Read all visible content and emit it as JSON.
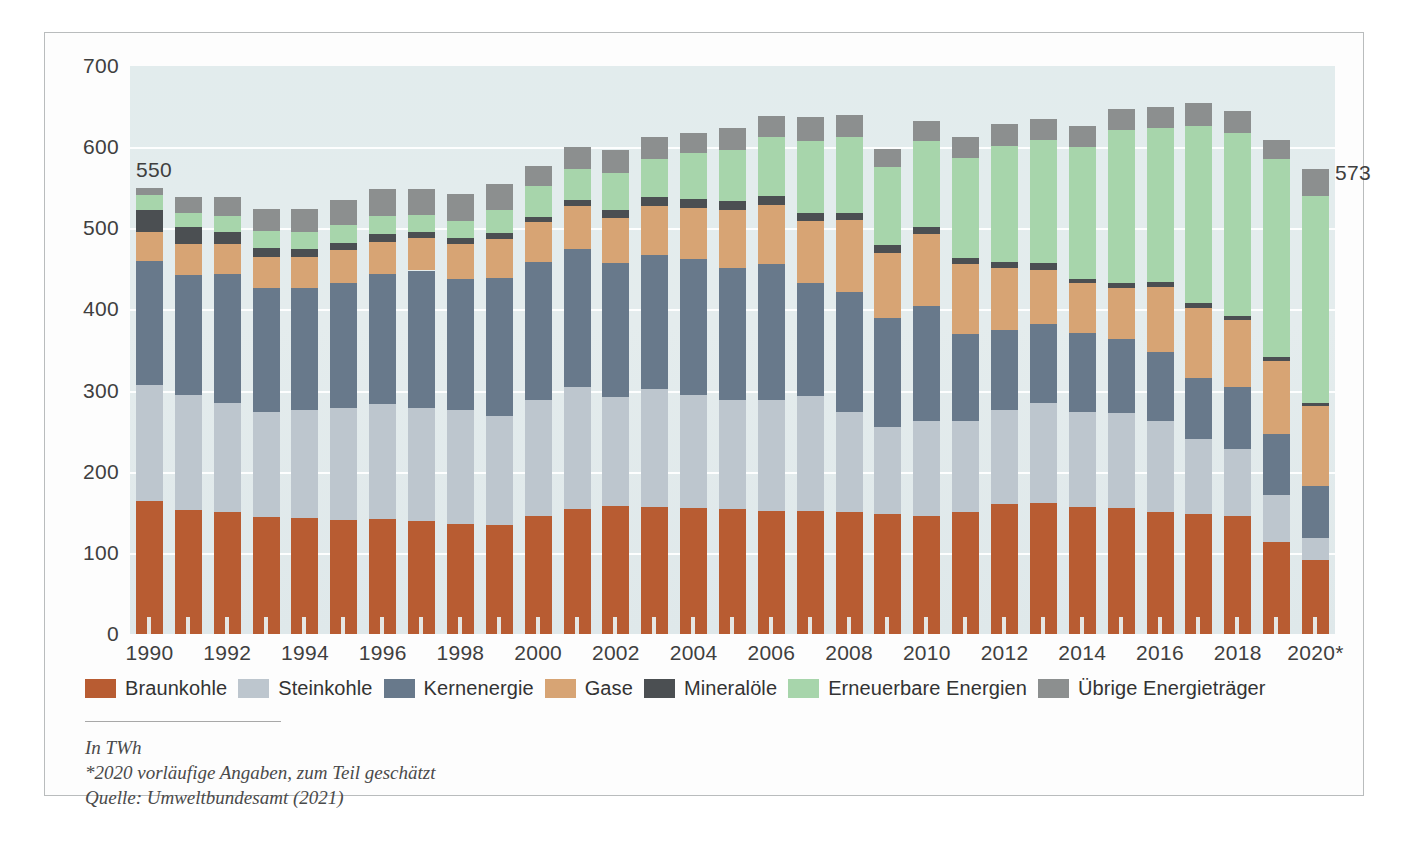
{
  "chart_data": {
    "type": "bar",
    "subtype": "stacked",
    "title": "",
    "xlabel": "",
    "ylabel": "",
    "unit": "TWh",
    "ylim": [
      0,
      700
    ],
    "yticks": [
      0,
      100,
      200,
      300,
      400,
      500,
      600,
      700
    ],
    "grid": true,
    "legend_position": "bottom",
    "categories": [
      "1990",
      "1991",
      "1992",
      "1993",
      "1994",
      "1995",
      "1996",
      "1997",
      "1998",
      "1999",
      "2000",
      "2001",
      "2002",
      "2003",
      "2004",
      "2005",
      "2006",
      "2007",
      "2008",
      "2009",
      "2010",
      "2011",
      "2012",
      "2013",
      "2014",
      "2015",
      "2016",
      "2017",
      "2018",
      "2019",
      "2020*"
    ],
    "xtick_labels": [
      "1990",
      "1992",
      "1994",
      "1996",
      "1998",
      "2000",
      "2002",
      "2004",
      "2006",
      "2008",
      "2010",
      "2012",
      "2014",
      "2016",
      "2018",
      "2020*"
    ],
    "series": [
      {
        "name": "Braunkohle",
        "color": "#b85c32",
        "values": [
          164,
          153,
          150,
          144,
          143,
          141,
          142,
          139,
          136,
          134,
          146,
          154,
          158,
          156,
          155,
          154,
          151,
          151,
          150,
          148,
          146,
          150,
          160,
          161,
          156,
          155,
          150,
          148,
          146,
          114,
          91
        ]
      },
      {
        "name": "Steinkohle",
        "color": "#bdc6ce",
        "values": [
          143,
          142,
          135,
          130,
          133,
          137,
          141,
          139,
          140,
          135,
          143,
          150,
          134,
          146,
          140,
          134,
          138,
          142,
          124,
          107,
          117,
          112,
          116,
          124,
          118,
          117,
          112,
          92,
          82,
          57,
          27
        ]
      },
      {
        "name": "Kernenergie",
        "color": "#68798b",
        "values": [
          153,
          148,
          159,
          153,
          151,
          154,
          161,
          170,
          162,
          170,
          170,
          171,
          165,
          165,
          167,
          163,
          167,
          140,
          148,
          135,
          141,
          108,
          99,
          97,
          97,
          92,
          85,
          76,
          76,
          75,
          64
        ]
      },
      {
        "name": "Gase",
        "color": "#d7a474",
        "values": [
          36,
          38,
          37,
          38,
          38,
          41,
          39,
          40,
          43,
          48,
          49,
          53,
          56,
          61,
          63,
          71,
          73,
          76,
          88,
          80,
          89,
          86,
          76,
          67,
          61,
          62,
          81,
          86,
          83,
          91,
          99
        ]
      },
      {
        "name": "Mineralöle",
        "color": "#4b4f52",
        "values": [
          26,
          21,
          15,
          11,
          10,
          9,
          10,
          8,
          7,
          7,
          6,
          7,
          9,
          10,
          11,
          12,
          11,
          10,
          9,
          10,
          9,
          7,
          8,
          8,
          6,
          6,
          6,
          6,
          5,
          5,
          4
        ]
      },
      {
        "name": "Erneuerbare Energien",
        "color": "#a7d5ab",
        "values": [
          19,
          17,
          19,
          21,
          20,
          22,
          22,
          21,
          21,
          28,
          38,
          38,
          46,
          47,
          57,
          63,
          72,
          88,
          93,
          95,
          105,
          124,
          143,
          152,
          162,
          189,
          189,
          218,
          226,
          244,
          255
        ]
      },
      {
        "name": "Übrige Energieträger",
        "color": "#8c8f8f",
        "values": [
          9,
          20,
          23,
          27,
          29,
          31,
          33,
          32,
          33,
          33,
          25,
          27,
          28,
          27,
          25,
          26,
          26,
          30,
          28,
          23,
          25,
          26,
          26,
          26,
          26,
          26,
          27,
          28,
          26,
          23,
          33
        ]
      }
    ],
    "annotations": [
      {
        "category": "1990",
        "text": "550",
        "value": 550
      },
      {
        "category": "2020*",
        "text": "573",
        "value": 573
      }
    ]
  },
  "footnotes": {
    "unit_line": "In TWh",
    "note_line": "*2020 vorläufige Angaben, zum Teil geschätzt",
    "source_line": "Quelle: Umweltbundesamt (2021)"
  }
}
